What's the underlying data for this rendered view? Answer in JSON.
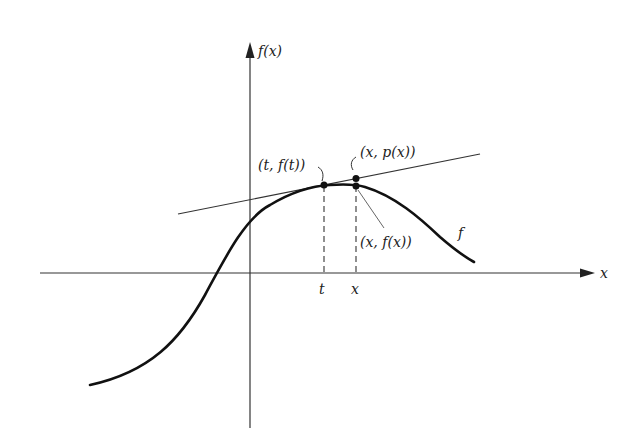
{
  "figure": {
    "colors": {
      "ink": "#222222",
      "background": "#ffffff"
    },
    "axes": {
      "x_label": "x",
      "y_label": "f(x)"
    },
    "curve": {
      "label": "f"
    },
    "tangent_line": {
      "label": "p"
    },
    "points": [
      {
        "id": "t-point",
        "label": "(t, f(t))"
      },
      {
        "id": "x-p-point",
        "label": "(x, p(x))"
      },
      {
        "id": "x-f-point",
        "label": "(x, f(x))"
      }
    ],
    "ticks": [
      {
        "label": "t"
      },
      {
        "label": "x"
      }
    ]
  }
}
